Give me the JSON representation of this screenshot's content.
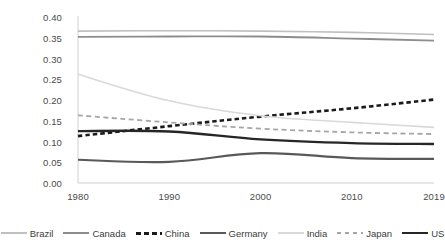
{
  "chart_data": {
    "type": "line",
    "title": "",
    "subtitle": "",
    "xlabel": "",
    "ylabel": "",
    "x": [
      1980,
      1990,
      2000,
      2010,
      2019
    ],
    "x_tick_labels": [
      "1980",
      "1990",
      "2000",
      "2010",
      "2019"
    ],
    "y_tick_labels": [
      "0.00",
      "0.05",
      "0.10",
      "0.15",
      "0.20",
      "0.25",
      "0.30",
      "0.35",
      "0.40"
    ],
    "y_ticks": [
      0.0,
      0.05,
      0.1,
      0.15,
      0.2,
      0.25,
      0.3,
      0.35,
      0.4
    ],
    "ylim": [
      0.0,
      0.4
    ],
    "xlim": [
      1980,
      2019
    ],
    "grid": false,
    "legend_position": "bottom",
    "series": [
      {
        "name": "Brazil",
        "color": "#bfbfbf",
        "style": "solid",
        "width": 1.6,
        "values": [
          0.366,
          0.367,
          0.366,
          0.363,
          0.358
        ]
      },
      {
        "name": "Canada",
        "color": "#8c8c8c",
        "style": "solid",
        "width": 1.8,
        "values": [
          0.352,
          0.353,
          0.353,
          0.348,
          0.343
        ]
      },
      {
        "name": "China",
        "color": "#1a1a1a",
        "style": "dashed",
        "width": 2.6,
        "values": [
          0.113,
          0.137,
          0.16,
          0.18,
          0.201
        ]
      },
      {
        "name": "Germany",
        "color": "#595959",
        "style": "solid",
        "width": 2.2,
        "values": [
          0.056,
          0.051,
          0.072,
          0.06,
          0.058
        ]
      },
      {
        "name": "India",
        "color": "#d9d9d9",
        "style": "solid",
        "width": 1.6,
        "values": [
          0.262,
          0.198,
          0.162,
          0.146,
          0.134
        ]
      },
      {
        "name": "Japan",
        "color": "#a6a6a6",
        "style": "dashed",
        "width": 1.8,
        "values": [
          0.163,
          0.146,
          0.131,
          0.122,
          0.118
        ]
      },
      {
        "name": "US",
        "color": "#262626",
        "style": "solid",
        "width": 2.4,
        "values": [
          0.125,
          0.124,
          0.105,
          0.096,
          0.094
        ]
      }
    ]
  },
  "axis": {
    "y_labels": [
      "0.40",
      "0.35",
      "0.30",
      "0.25",
      "0.20",
      "0.15",
      "0.10",
      "0.05",
      "0.00"
    ],
    "x_labels": [
      "1980",
      "1990",
      "2000",
      "2010",
      "2019"
    ]
  },
  "legend": {
    "items": [
      {
        "label": "Brazil"
      },
      {
        "label": "Canada"
      },
      {
        "label": "China"
      },
      {
        "label": "Germany"
      },
      {
        "label": "India"
      },
      {
        "label": "Japan"
      },
      {
        "label": "US"
      }
    ]
  }
}
